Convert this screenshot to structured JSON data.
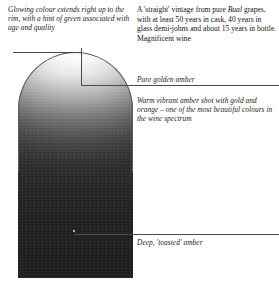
{
  "diagram": {
    "type": "annotated-colour-swatch"
  },
  "captions": {
    "rim": "Glowing colour extends right up to the rim, with a hint of green associated with age and quality",
    "vintage_pre": "A 'straight' vintage from pure ",
    "vintage_italic": "Bual",
    "vintage_post": " grapes, with at least 50 years in cask, 40 years in glass demi-johns and about 15 years in bottle. Magnificent wine",
    "golden": "Pure golden amber",
    "warm": "Warm vibrant amber shot with gold and orange – one of the most beautiful colours in the wine spectrum",
    "deep": "Deep, 'toasted' amber"
  },
  "colors": {
    "swatch_top": "#ffffff",
    "swatch_mid": "#8a8a8a",
    "swatch_bottom": "#2a2a2a",
    "leader_line": "#4a4a4a",
    "hairline": "#b9b9b9",
    "text": "#1a1a1a",
    "page_background": "#ffffff"
  }
}
